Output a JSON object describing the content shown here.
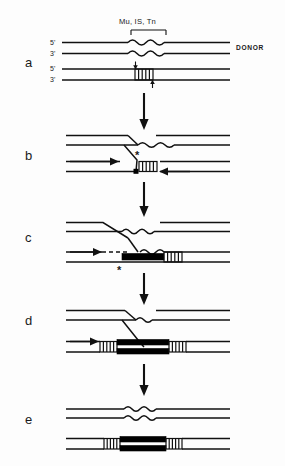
{
  "figure": {
    "background_color": "#fdfdfd",
    "ink_color": "#111111",
    "width": 285,
    "height": 466
  },
  "annotations": {
    "transposon_label": "Mu, IS, Tn",
    "donor_label": "DONOR",
    "recipient_label": "RECIPIENT",
    "five_prime": "5'",
    "three_prime": "3'",
    "asterisk": "*"
  },
  "panels": [
    {
      "id": "a",
      "letter": "a",
      "description": "Donor duplex carrying transposon (wavy) above recipient duplex with staggered cut site (hatched box); small arrows mark nick positions on recipient strands.",
      "elements": [
        "donor-duplex",
        "transposon-wavy",
        "recipient-duplex",
        "target-hatched-box",
        "nick-arrow-top",
        "nick-arrow-bottom",
        "five-prime-labels",
        "three-prime-labels"
      ]
    },
    {
      "id": "b",
      "letter": "b",
      "description": "Strand transfer intermediate: donor 3' end joined to recipient via crossed strand; asterisk marks free 3'-OH; square marks joined end; horizontal arrows show replication direction.",
      "elements": [
        "crossed-strand",
        "asterisk-marker",
        "square-marker",
        "hatched-box",
        "replication-arrow-right",
        "replication-arrow-left"
      ]
    },
    {
      "id": "c",
      "letter": "c",
      "description": "Replication initiated: dashed newly synthesized strand with thick black bar; wavy transposon copied; asterisk below.",
      "elements": [
        "dashed-new-strand",
        "thick-bar",
        "wavy-segment",
        "hatched-box",
        "asterisk-marker",
        "replication-arrow-right"
      ]
    },
    {
      "id": "d",
      "letter": "d",
      "description": "Cointegrate structure: fully replicated transposon as thick double black bars flanked by hatched duplications on both sides.",
      "elements": [
        "thick-double-bar",
        "hatched-box-left",
        "hatched-box-right",
        "crossed-strand",
        "wavy-segment",
        "replication-arrow-right"
      ]
    },
    {
      "id": "e",
      "letter": "e",
      "description": "Resolved products: donor duplex with wavy transposon copy above, recipient duplex with thick black transposon flanked by hatched direct repeats below.",
      "elements": [
        "product-duplex-top",
        "wavy-segment",
        "product-duplex-bottom",
        "thick-double-bar",
        "hatched-box-left",
        "hatched-box-right"
      ]
    }
  ],
  "flow_arrows": [
    {
      "from": "a",
      "to": "b"
    },
    {
      "from": "b",
      "to": "c"
    },
    {
      "from": "c",
      "to": "d"
    },
    {
      "from": "d",
      "to": "e"
    }
  ]
}
